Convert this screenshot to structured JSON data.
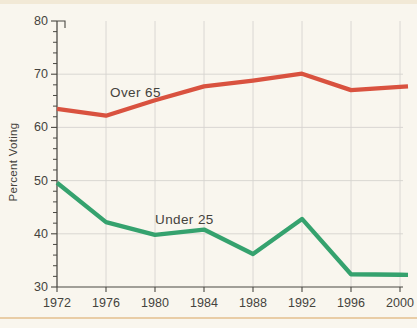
{
  "page": {
    "background_color": "#f9f6ee",
    "top_band_color": "#f2e9d6",
    "bottom_rule_color": "#e9cda6",
    "axis_color": "#4a4842",
    "grid_color": "#d6d4cf",
    "text_color": "#45433d"
  },
  "chart_data": {
    "type": "line",
    "title": "",
    "xlabel": "",
    "ylabel": "Percent Voting",
    "x": [
      1972,
      1976,
      1980,
      1984,
      1988,
      1992,
      1996,
      2000
    ],
    "xtick_labels": [
      "1972",
      "1976",
      "1980",
      "1984",
      "1988",
      "1992",
      "1996",
      "2000"
    ],
    "xlim": [
      1972,
      2000
    ],
    "ylim": [
      30,
      80
    ],
    "yticks": [
      30,
      40,
      50,
      60,
      70,
      80
    ],
    "ytick_labels": [
      "30",
      "40",
      "50",
      "60",
      "70",
      "80"
    ],
    "ytick_minor_step": 2,
    "grid": true,
    "legend_position": "inline-labels-on-lines",
    "series": [
      {
        "name": "Over 65",
        "color": "#d9523f",
        "values": [
          63.5,
          62.2,
          65.1,
          67.7,
          68.8,
          70.1,
          67.0,
          67.6
        ]
      },
      {
        "name": "Under 25",
        "color": "#35a26e",
        "values": [
          49.6,
          42.2,
          39.8,
          40.8,
          36.2,
          42.8,
          32.4,
          32.3
        ]
      }
    ]
  }
}
